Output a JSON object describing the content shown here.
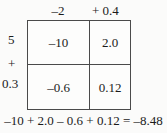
{
  "diagram": {
    "type": "area-model-multiplication-grid",
    "column_headers": {
      "left": "–2",
      "right": "+ 0.4"
    },
    "row_labels": {
      "first": "5",
      "operator": "+",
      "second": "0.3"
    },
    "cells": [
      {
        "row": 0,
        "col": 0,
        "value": "–10"
      },
      {
        "row": 0,
        "col": 1,
        "value": "2.0"
      },
      {
        "row": 1,
        "col": 0,
        "value": "–0.6"
      },
      {
        "row": 1,
        "col": 1,
        "value": "0.12"
      }
    ],
    "equation": "–10 + 2.0 – 0.6 + 0.12 = –8.48",
    "colors": {
      "background": "#fbfbfa",
      "cell_fill": "#fdfdfc",
      "line": "#4a4a4a",
      "text": "#1a1a1a"
    }
  }
}
